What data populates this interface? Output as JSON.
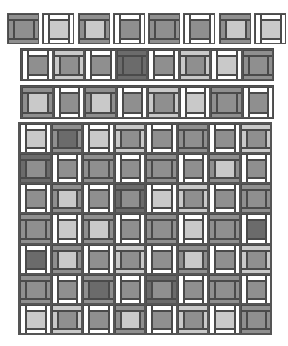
{
  "palette": {
    "D": "#6b6b6b",
    "M": "#8f8f8f",
    "L": "#c9c9c9",
    "W": "#ffffff",
    "line": "#4a4a4a"
  },
  "strips": [
    {
      "name": "strip-1",
      "x": 7,
      "y": 13,
      "block_w": 32,
      "block_h": 31,
      "gap": 3.3,
      "blocks": [
        [
          "A",
          "M",
          "M"
        ],
        [
          "B",
          "W",
          "L"
        ],
        [
          "A",
          "M",
          "L"
        ],
        [
          "B",
          "W",
          "M"
        ],
        [
          "A",
          "M",
          "M"
        ],
        [
          "B",
          "W",
          "M"
        ],
        [
          "A",
          "M",
          "L"
        ],
        [
          "B",
          "W",
          "L"
        ]
      ]
    },
    {
      "name": "strip-2",
      "x": 20,
      "y": 48,
      "block_w": 31.5,
      "block_h": 31,
      "gap": 0,
      "blocks": [
        [
          "B",
          "W",
          "M"
        ],
        [
          "A",
          "L",
          "M"
        ],
        [
          "B",
          "W",
          "M"
        ],
        [
          "A",
          "D",
          "D"
        ],
        [
          "B",
          "W",
          "M"
        ],
        [
          "A",
          "L",
          "M"
        ],
        [
          "B",
          "W",
          "L"
        ],
        [
          "A",
          "M",
          "M"
        ]
      ]
    },
    {
      "name": "strip-3",
      "x": 20,
      "y": 85,
      "block_w": 31.5,
      "block_h": 32,
      "gap": 0,
      "blocks": [
        [
          "A",
          "M",
          "L"
        ],
        [
          "B",
          "W",
          "M"
        ],
        [
          "A",
          "M",
          "L"
        ],
        [
          "B",
          "W",
          "M"
        ],
        [
          "A",
          "L",
          "M"
        ],
        [
          "B",
          "W",
          "L"
        ],
        [
          "A",
          "M",
          "M"
        ],
        [
          "B",
          "W",
          "M"
        ]
      ]
    }
  ],
  "grid": {
    "name": "quilt-grid",
    "x": 18,
    "y": 122,
    "w": 254,
    "h": 213,
    "cols": 8,
    "rows": 7,
    "blocks": [
      [
        [
          "B",
          "W",
          "L"
        ],
        [
          "A",
          "M",
          "D"
        ],
        [
          "B",
          "W",
          "L"
        ],
        [
          "A",
          "L",
          "M"
        ],
        [
          "B",
          "W",
          "M"
        ],
        [
          "A",
          "M",
          "M"
        ],
        [
          "B",
          "W",
          "M"
        ],
        [
          "A",
          "L",
          "M"
        ]
      ],
      [
        [
          "A",
          "D",
          "M"
        ],
        [
          "B",
          "W",
          "M"
        ],
        [
          "A",
          "M",
          "M"
        ],
        [
          "B",
          "W",
          "M"
        ],
        [
          "A",
          "M",
          "M"
        ],
        [
          "B",
          "W",
          "M"
        ],
        [
          "A",
          "M",
          "L"
        ],
        [
          "B",
          "W",
          "M"
        ]
      ],
      [
        [
          "B",
          "W",
          "M"
        ],
        [
          "A",
          "M",
          "L"
        ],
        [
          "B",
          "W",
          "M"
        ],
        [
          "A",
          "D",
          "M"
        ],
        [
          "B",
          "W",
          "L"
        ],
        [
          "A",
          "L",
          "M"
        ],
        [
          "B",
          "W",
          "M"
        ],
        [
          "A",
          "M",
          "M"
        ]
      ],
      [
        [
          "A",
          "M",
          "M"
        ],
        [
          "B",
          "W",
          "L"
        ],
        [
          "A",
          "M",
          "L"
        ],
        [
          "B",
          "W",
          "M"
        ],
        [
          "A",
          "M",
          "M"
        ],
        [
          "B",
          "W",
          "L"
        ],
        [
          "A",
          "M",
          "M"
        ],
        [
          "B",
          "W",
          "D"
        ]
      ],
      [
        [
          "B",
          "W",
          "D"
        ],
        [
          "A",
          "M",
          "L"
        ],
        [
          "B",
          "W",
          "M"
        ],
        [
          "A",
          "L",
          "M"
        ],
        [
          "B",
          "W",
          "M"
        ],
        [
          "A",
          "M",
          "L"
        ],
        [
          "B",
          "W",
          "M"
        ],
        [
          "A",
          "L",
          "M"
        ]
      ],
      [
        [
          "A",
          "M",
          "M"
        ],
        [
          "B",
          "W",
          "M"
        ],
        [
          "A",
          "M",
          "D"
        ],
        [
          "B",
          "W",
          "M"
        ],
        [
          "A",
          "D",
          "M"
        ],
        [
          "B",
          "W",
          "M"
        ],
        [
          "A",
          "M",
          "M"
        ],
        [
          "B",
          "W",
          "M"
        ]
      ],
      [
        [
          "B",
          "W",
          "L"
        ],
        [
          "A",
          "L",
          "M"
        ],
        [
          "B",
          "W",
          "M"
        ],
        [
          "A",
          "M",
          "L"
        ],
        [
          "B",
          "W",
          "M"
        ],
        [
          "A",
          "L",
          "M"
        ],
        [
          "B",
          "W",
          "L"
        ],
        [
          "A",
          "M",
          "M"
        ]
      ]
    ]
  }
}
